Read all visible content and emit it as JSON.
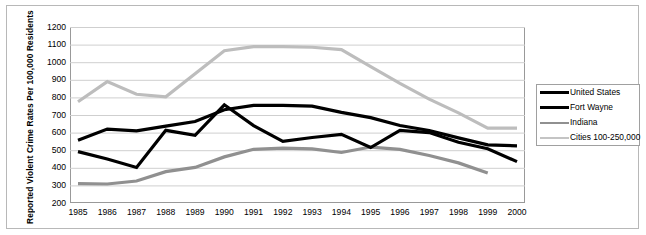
{
  "chart_data": {
    "type": "line",
    "title": "",
    "xlabel": "",
    "ylabel": "Reported Violent Crime Rates Per 100,000 Residents",
    "ylim": [
      200,
      1200
    ],
    "ytick_step": 100,
    "yticks": [
      1200,
      1100,
      1000,
      900,
      800,
      700,
      600,
      500,
      400,
      300,
      200
    ],
    "grid": true,
    "legend_position": "right",
    "categories": [
      1985,
      1986,
      1987,
      1988,
      1989,
      1990,
      1991,
      1992,
      1993,
      1994,
      1995,
      1996,
      1997,
      1998,
      1999,
      2000
    ],
    "x_tick_labels": [
      "1985",
      "1986",
      "1987",
      "1988",
      "1989",
      "1990",
      "1991",
      "1992",
      "1993",
      "1994",
      "1995",
      "1996",
      "1997",
      "1998",
      "1999",
      "2000"
    ],
    "series": [
      {
        "name": "United States",
        "color": "#000000",
        "width": 3.2,
        "values": [
          557,
          620,
          610,
          637,
          663,
          730,
          755,
          755,
          750,
          715,
          685,
          640,
          612,
          570,
          530,
          525
        ]
      },
      {
        "name": "Fort Wayne",
        "color": "#000000",
        "width": 3.2,
        "values": [
          492,
          450,
          402,
          613,
          585,
          758,
          640,
          550,
          572,
          590,
          515,
          612,
          600,
          545,
          508,
          435
        ]
      },
      {
        "name": "Indiana",
        "color": "#909090",
        "width": 3.2,
        "values": [
          310,
          308,
          325,
          378,
          402,
          462,
          505,
          512,
          508,
          487,
          518,
          505,
          470,
          428,
          370,
          null
        ]
      },
      {
        "name": "Cities 100-250,000",
        "color": "#bdbdbd",
        "width": 3.2,
        "values": [
          775,
          890,
          818,
          803,
          935,
          1065,
          1088,
          1088,
          1085,
          1072,
          975,
          880,
          790,
          712,
          625,
          625
        ]
      }
    ]
  },
  "legend": {
    "entries": [
      {
        "label": "United States",
        "color": "#000000",
        "thin": false
      },
      {
        "label": "Fort Wayne",
        "color": "#000000",
        "thin": false
      },
      {
        "label": "Indiana",
        "color": "#909090",
        "thin": true
      },
      {
        "label": "Cities 100-250,000",
        "color": "#c4c4c4",
        "thin": true
      }
    ]
  },
  "axis": {
    "y_title": "Reported Violent Crime Rates Per 100,000 Residents"
  }
}
